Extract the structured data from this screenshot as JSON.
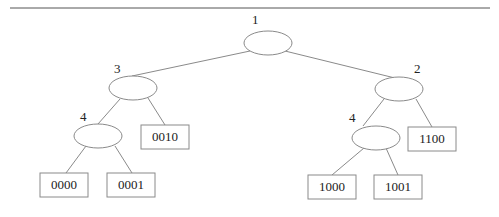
{
  "diagram": {
    "type": "binary-trie",
    "colors": {
      "stroke": "#8a8a8a",
      "text": "#222222",
      "rule": "#555555"
    },
    "nodes": [
      {
        "id": "n1",
        "label": "1",
        "cx": 268,
        "cy": 43,
        "lx": 252,
        "ly": 24
      },
      {
        "id": "n3",
        "label": "3",
        "cx": 133,
        "cy": 88,
        "lx": 114,
        "ly": 73
      },
      {
        "id": "n2",
        "label": "2",
        "cx": 399,
        "cy": 89,
        "lx": 414,
        "ly": 73
      },
      {
        "id": "n4a",
        "label": "4",
        "cx": 98,
        "cy": 136,
        "lx": 80,
        "ly": 121
      },
      {
        "id": "n4b",
        "label": "4",
        "cx": 376,
        "cy": 138,
        "lx": 349,
        "ly": 122
      }
    ],
    "leaves": [
      {
        "id": "l0010",
        "label": "0010",
        "x": 141,
        "y": 125
      },
      {
        "id": "l0000",
        "label": "0000",
        "x": 40,
        "y": 173
      },
      {
        "id": "l0001",
        "label": "0001",
        "x": 107,
        "y": 173
      },
      {
        "id": "l1100",
        "label": "1100",
        "x": 408,
        "y": 127
      },
      {
        "id": "l1000",
        "label": "1000",
        "x": 308,
        "y": 175
      },
      {
        "id": "l1001",
        "label": "1001",
        "x": 374,
        "y": 175
      }
    ]
  }
}
